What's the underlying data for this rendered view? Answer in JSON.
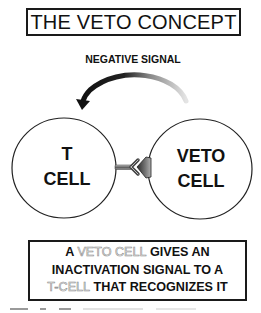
{
  "title": "THE VETO CONCEPT",
  "signal": {
    "label": "NEGATIVE SIGNAL",
    "arrow_icon": "curved-arrow-left",
    "arrow_colors": {
      "head": "#111111",
      "tail": "#d8d8d8"
    }
  },
  "cells": {
    "t_cell": {
      "line1": "T",
      "line2": "CELL"
    },
    "veto_cell": {
      "line1": "VETO",
      "line2": "CELL"
    }
  },
  "interaction": {
    "receptor_icon": "y-shaped-receptor",
    "ligand_icon": "wedge-ligand",
    "ligand_color": "#555555"
  },
  "statement": {
    "line1": {
      "pre": "A",
      "hollow": "VETO CELL",
      "post": "GIVES AN"
    },
    "line2": {
      "text": "INACTIVATION SIGNAL TO A"
    },
    "line3": {
      "hollow": "T-CELL",
      "post": "THAT RECOGNIZES IT"
    }
  },
  "colors": {
    "ink": "#111111",
    "hollow_outline": "#8a8a8a",
    "background": "#ffffff"
  }
}
